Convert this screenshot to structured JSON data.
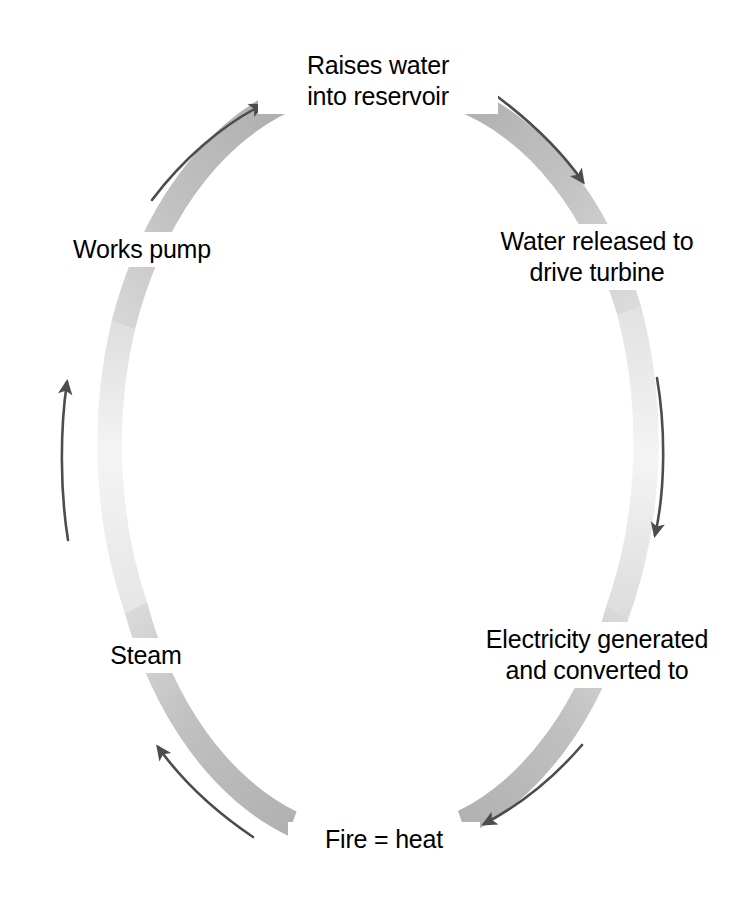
{
  "diagram": {
    "type": "cyclical-loop",
    "direction": "clockwise",
    "ring_color_dark": "#b3b3b3",
    "ring_color_light": "#f2f2f2",
    "arrow_color": "#4d4d4d",
    "background": "#ffffff",
    "nodes": [
      {
        "id": "raises-water",
        "label": "Raises water\ninto reservoir",
        "position": "top"
      },
      {
        "id": "water-released",
        "label": "Water released to\ndrive turbine",
        "position": "upper-right"
      },
      {
        "id": "electricity",
        "label": "Electricity generated\nand converted to",
        "position": "lower-right"
      },
      {
        "id": "fire-heat",
        "label": "Fire = heat",
        "position": "bottom"
      },
      {
        "id": "steam",
        "label": "Steam",
        "position": "lower-left"
      },
      {
        "id": "works-pump",
        "label": "Works pump",
        "position": "upper-left"
      }
    ],
    "arrows": [
      {
        "id": "arrow-top-right",
        "from": "raises-water",
        "to": "water-released",
        "icon": "curved-arrow-icon"
      },
      {
        "id": "arrow-right",
        "from": "water-released",
        "to": "electricity",
        "icon": "curved-arrow-icon"
      },
      {
        "id": "arrow-bottom-right",
        "from": "electricity",
        "to": "fire-heat",
        "icon": "curved-arrow-icon"
      },
      {
        "id": "arrow-bottom-left",
        "from": "fire-heat",
        "to": "steam",
        "icon": "curved-arrow-icon"
      },
      {
        "id": "arrow-left",
        "from": "steam",
        "to": "works-pump",
        "icon": "curved-arrow-icon"
      },
      {
        "id": "arrow-top-left",
        "from": "works-pump",
        "to": "raises-water",
        "icon": "curved-arrow-icon"
      }
    ]
  }
}
